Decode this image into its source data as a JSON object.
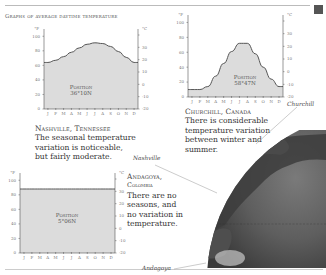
{
  "page": {
    "heading": "Graphs of average daytime temperature",
    "accent_square_color": "#555555"
  },
  "chart_data": [
    {
      "type": "area",
      "title": "Nashville, Tennessee",
      "position_label": "Position",
      "position_value": "36°10N",
      "x": [
        "J",
        "F",
        "M",
        "A",
        "M",
        "J",
        "J",
        "A",
        "S",
        "O",
        "N",
        "D"
      ],
      "values_f": [
        64,
        67,
        72,
        78,
        84,
        89,
        91,
        90,
        86,
        79,
        71,
        64
      ],
      "left_axis": {
        "unit": "°F",
        "ticks": [
          0,
          20,
          40,
          60,
          80,
          100
        ],
        "range": [
          0,
          110
        ]
      },
      "right_axis": {
        "unit": "°C",
        "ticks": [
          -20,
          -10,
          0,
          10,
          20,
          30,
          40
        ]
      }
    },
    {
      "type": "area",
      "title": "Churchill, Canada",
      "position_label": "Position",
      "position_value": "58°47N",
      "x": [
        "J",
        "F",
        "M",
        "A",
        "M",
        "J",
        "J",
        "A",
        "S",
        "O",
        "N",
        "D"
      ],
      "values_f": [
        10,
        10,
        14,
        28,
        45,
        61,
        72,
        72,
        58,
        40,
        24,
        14
      ],
      "left_axis": {
        "unit": "°F",
        "ticks": [
          0,
          20,
          40,
          60,
          80,
          100
        ],
        "range": [
          0,
          110
        ]
      },
      "right_axis": {
        "unit": "°C",
        "ticks": [
          -20,
          -10,
          0,
          10,
          20,
          30,
          40
        ]
      }
    },
    {
      "type": "area",
      "title": "Andagoya, Colombia",
      "position_label": "Position",
      "position_value": "5°06N",
      "x": [
        "J",
        "F",
        "M",
        "A",
        "M",
        "J",
        "J",
        "A",
        "S",
        "O",
        "N",
        "D"
      ],
      "values_f": [
        88,
        88,
        88,
        88,
        88,
        88,
        88,
        88,
        88,
        88,
        88,
        88
      ],
      "left_axis": {
        "unit": "°F",
        "ticks": [
          0,
          20,
          40,
          60,
          80,
          100
        ],
        "range": [
          0,
          110
        ]
      },
      "right_axis": {
        "unit": "°C",
        "ticks": [
          -20,
          -10,
          0,
          10,
          20,
          30,
          40
        ]
      }
    }
  ],
  "captions": {
    "nashville": {
      "title": "Nashville, Tennessee",
      "lines": [
        "The seasonal temperature",
        "variation is noticeable,",
        "but fairly moderate."
      ]
    },
    "churchill": {
      "title": "Churchill, Canada",
      "lines": [
        "There is considerable",
        "temperature variation",
        "between winter and",
        "summer."
      ]
    },
    "andagoya": {
      "title": "Andagoya,",
      "subtitle": "Colombia",
      "lines": [
        "There are no",
        "seasons, and",
        "no variation in",
        "temperature."
      ]
    }
  },
  "map_labels": {
    "churchill": "Churchill",
    "nashville": "Nashville",
    "andagoya": "Andagoya"
  }
}
